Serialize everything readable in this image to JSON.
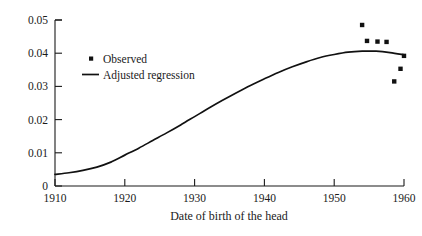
{
  "chart_data": {
    "type": "line",
    "title": "",
    "xlabel": "Date of birth of the head",
    "ylabel": "",
    "xlim": [
      1910,
      1960
    ],
    "ylim": [
      0,
      0.05
    ],
    "grid": false,
    "legend_position": "upper-left-inside",
    "x_ticks": [
      1910,
      1920,
      1930,
      1940,
      1950,
      1960
    ],
    "x_tick_labels": [
      "1910",
      "1920",
      "1930",
      "1940",
      "1950",
      "1960"
    ],
    "y_ticks": [
      0,
      0.01,
      0.02,
      0.03,
      0.04,
      0.05
    ],
    "y_tick_labels": [
      "0",
      "0.01",
      "0.02",
      "0.03",
      "0.04",
      "0.05"
    ],
    "series": [
      {
        "name": "Observed",
        "type": "scatter",
        "marker": "square",
        "color": "#111111",
        "points": [
          {
            "x": 1954.0,
            "y": 0.0485
          },
          {
            "x": 1954.7,
            "y": 0.0437
          },
          {
            "x": 1956.2,
            "y": 0.0435
          },
          {
            "x": 1957.5,
            "y": 0.0434
          },
          {
            "x": 1958.6,
            "y": 0.0315
          },
          {
            "x": 1959.5,
            "y": 0.0353
          },
          {
            "x": 1960.0,
            "y": 0.0392
          }
        ]
      },
      {
        "name": "Adjusted regression",
        "type": "line",
        "color": "#111111",
        "points": [
          {
            "x": 1910,
            "y": 0.0035
          },
          {
            "x": 1912,
            "y": 0.004
          },
          {
            "x": 1914,
            "y": 0.0047
          },
          {
            "x": 1916,
            "y": 0.0057
          },
          {
            "x": 1918,
            "y": 0.0072
          },
          {
            "x": 1920,
            "y": 0.0093
          },
          {
            "x": 1922,
            "y": 0.0114
          },
          {
            "x": 1924,
            "y": 0.0137
          },
          {
            "x": 1926,
            "y": 0.016
          },
          {
            "x": 1928,
            "y": 0.0184
          },
          {
            "x": 1930,
            "y": 0.0209
          },
          {
            "x": 1932,
            "y": 0.0234
          },
          {
            "x": 1934,
            "y": 0.0258
          },
          {
            "x": 1936,
            "y": 0.0281
          },
          {
            "x": 1938,
            "y": 0.0303
          },
          {
            "x": 1940,
            "y": 0.0323
          },
          {
            "x": 1942,
            "y": 0.0342
          },
          {
            "x": 1944,
            "y": 0.0359
          },
          {
            "x": 1946,
            "y": 0.0374
          },
          {
            "x": 1948,
            "y": 0.0387
          },
          {
            "x": 1950,
            "y": 0.0396
          },
          {
            "x": 1952,
            "y": 0.0403
          },
          {
            "x": 1954,
            "y": 0.0406
          },
          {
            "x": 1956,
            "y": 0.0406
          },
          {
            "x": 1958,
            "y": 0.0402
          },
          {
            "x": 1960,
            "y": 0.0395
          }
        ]
      }
    ],
    "legend_entries": [
      {
        "label": "Observed",
        "symbol": "square-marker",
        "color": "#111111"
      },
      {
        "label": "Adjusted regression",
        "symbol": "line",
        "color": "#111111"
      }
    ]
  }
}
